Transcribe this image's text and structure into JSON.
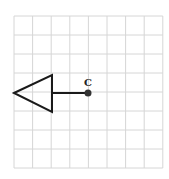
{
  "diagram": {
    "type": "grid-figure",
    "grid": {
      "columns": 8,
      "rows": 8,
      "origin_px": [
        14,
        16
      ],
      "cell_w": 18.6,
      "cell_h": 19,
      "line_color": "#d6d6d6"
    },
    "shape": {
      "kind": "triangle",
      "points": [
        [
          14,
          93
        ],
        [
          52,
          75
        ],
        [
          52,
          112
        ]
      ],
      "stroke": "#1a1a1a"
    },
    "segment": {
      "from": [
        52,
        93
      ],
      "to": [
        88,
        93
      ],
      "stroke": "#1a1a1a"
    },
    "point": {
      "label": "C",
      "position": [
        88,
        93
      ],
      "color": "#333333"
    }
  }
}
